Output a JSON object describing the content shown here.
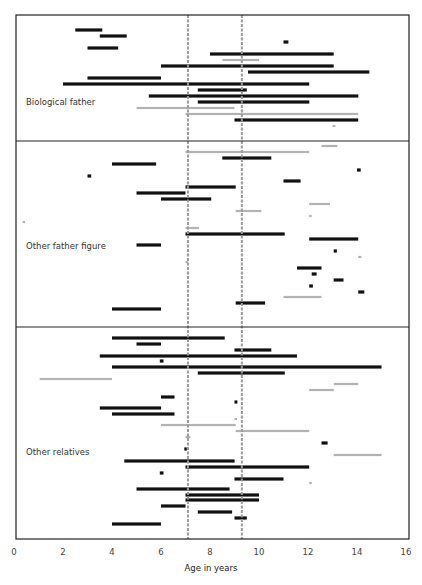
{
  "chart_data": {
    "type": "bar",
    "subtype": "horizontal-range (gantt-like) timeline",
    "title": "",
    "xlabel": "Age in years",
    "ylabel": "",
    "xlim": [
      0,
      16
    ],
    "xticks": [
      0,
      2,
      4,
      6,
      8,
      10,
      12,
      14,
      16
    ],
    "grid": false,
    "legend": null,
    "reference_lines": [
      {
        "x": 7.1,
        "style": "dashed",
        "color": "#9a9a9a"
      },
      {
        "x": 9.3,
        "style": "dashed",
        "color": "#9a9a9a"
      }
    ],
    "colors": {
      "black": "#111111",
      "gray": "#b3b3b3"
    },
    "panels": [
      {
        "label": "Biological father",
        "bars": [
          {
            "y": 30,
            "start": 2.5,
            "end": 3.6,
            "color": "black"
          },
          {
            "y": 36,
            "start": 3.5,
            "end": 4.6,
            "color": "black"
          },
          {
            "y": 42,
            "start": 11.0,
            "end": 11.2,
            "color": "black"
          },
          {
            "y": 48,
            "start": 3.0,
            "end": 4.25,
            "color": "black"
          },
          {
            "y": 54,
            "start": 8.0,
            "end": 13.05,
            "color": "black"
          },
          {
            "y": 60,
            "start": 8.5,
            "end": 10.0,
            "color": "gray"
          },
          {
            "y": 66,
            "start": 6.0,
            "end": 13.05,
            "color": "black"
          },
          {
            "y": 72,
            "start": 9.55,
            "end": 14.5,
            "color": "black"
          },
          {
            "y": 78,
            "start": 3.0,
            "end": 6.0,
            "color": "black"
          },
          {
            "y": 84,
            "start": 2.0,
            "end": 12.05,
            "color": "black"
          },
          {
            "y": 90,
            "start": 7.5,
            "end": 9.5,
            "color": "black"
          },
          {
            "y": 96,
            "start": 5.5,
            "end": 14.05,
            "color": "black"
          },
          {
            "y": 102,
            "start": 7.5,
            "end": 12.05,
            "color": "black"
          },
          {
            "y": 108,
            "start": 5.0,
            "end": 9.0,
            "color": "gray"
          },
          {
            "y": 114,
            "start": 7.0,
            "end": 14.05,
            "color": "gray"
          },
          {
            "y": 120,
            "start": 9.0,
            "end": 14.05,
            "color": "black"
          },
          {
            "y": 126,
            "start": 13.0,
            "end": 13.12,
            "color": "gray"
          }
        ]
      },
      {
        "label": "Other father figure",
        "bars": [
          {
            "y": 146,
            "start": 12.55,
            "end": 13.2,
            "color": "gray"
          },
          {
            "y": 152,
            "start": 7.0,
            "end": 12.05,
            "color": "gray"
          },
          {
            "y": 158,
            "start": 8.5,
            "end": 10.5,
            "color": "black"
          },
          {
            "y": 164,
            "start": 4.0,
            "end": 5.8,
            "color": "black"
          },
          {
            "y": 170,
            "start": 14.0,
            "end": 14.15,
            "color": "black"
          },
          {
            "y": 176,
            "start": 3.0,
            "end": 3.15,
            "color": "black"
          },
          {
            "y": 181,
            "start": 11.0,
            "end": 11.7,
            "color": "black"
          },
          {
            "y": 187,
            "start": 7.0,
            "end": 9.05,
            "color": "black"
          },
          {
            "y": 193,
            "start": 5.0,
            "end": 7.0,
            "color": "black"
          },
          {
            "y": 199,
            "start": 6.0,
            "end": 8.05,
            "color": "black"
          },
          {
            "y": 204,
            "start": 12.05,
            "end": 12.9,
            "color": "gray"
          },
          {
            "y": 211,
            "start": 9.05,
            "end": 10.1,
            "color": "gray"
          },
          {
            "y": 216,
            "start": 12.05,
            "end": 12.15,
            "color": "gray"
          },
          {
            "y": 222,
            "start": 0.35,
            "end": 0.45,
            "color": "gray"
          },
          {
            "y": 228,
            "start": 7.0,
            "end": 7.55,
            "color": "gray"
          },
          {
            "y": 234,
            "start": 7.0,
            "end": 11.05,
            "color": "black"
          },
          {
            "y": 239,
            "start": 12.05,
            "end": 14.05,
            "color": "black"
          },
          {
            "y": 245,
            "start": 5.0,
            "end": 6.0,
            "color": "black"
          },
          {
            "y": 251,
            "start": 13.05,
            "end": 13.18,
            "color": "black"
          },
          {
            "y": 257,
            "start": 14.05,
            "end": 14.18,
            "color": "gray"
          },
          {
            "y": 262,
            "start": 7.0,
            "end": 7.08,
            "color": "gray"
          },
          {
            "y": 268,
            "start": 11.55,
            "end": 12.55,
            "color": "black"
          },
          {
            "y": 274,
            "start": 12.15,
            "end": 12.35,
            "color": "black"
          },
          {
            "y": 280,
            "start": 13.05,
            "end": 13.45,
            "color": "black"
          },
          {
            "y": 286,
            "start": 12.05,
            "end": 12.2,
            "color": "black"
          },
          {
            "y": 292,
            "start": 14.05,
            "end": 14.3,
            "color": "black"
          },
          {
            "y": 297,
            "start": 11.0,
            "end": 12.55,
            "color": "gray"
          },
          {
            "y": 303,
            "start": 9.05,
            "end": 10.25,
            "color": "black"
          },
          {
            "y": 309,
            "start": 4.0,
            "end": 6.0,
            "color": "black"
          }
        ]
      },
      {
        "label": "Other relatives",
        "bars": [
          {
            "y": 338,
            "start": 4.0,
            "end": 8.6,
            "color": "black"
          },
          {
            "y": 344,
            "start": 5.0,
            "end": 6.0,
            "color": "black"
          },
          {
            "y": 350,
            "start": 9.0,
            "end": 10.5,
            "color": "black"
          },
          {
            "y": 356,
            "start": 3.5,
            "end": 11.55,
            "color": "black"
          },
          {
            "y": 361,
            "start": 5.95,
            "end": 6.1,
            "color": "black"
          },
          {
            "y": 367,
            "start": 4.0,
            "end": 15.0,
            "color": "black"
          },
          {
            "y": 373,
            "start": 7.5,
            "end": 11.05,
            "color": "black"
          },
          {
            "y": 379,
            "start": 1.05,
            "end": 4.0,
            "color": "gray"
          },
          {
            "y": 384,
            "start": 13.05,
            "end": 14.05,
            "color": "gray"
          },
          {
            "y": 390,
            "start": 12.05,
            "end": 13.05,
            "color": "gray"
          },
          {
            "y": 397,
            "start": 6.0,
            "end": 6.55,
            "color": "black"
          },
          {
            "y": 402,
            "start": 9.0,
            "end": 9.12,
            "color": "black"
          },
          {
            "y": 408,
            "start": 3.5,
            "end": 6.0,
            "color": "black"
          },
          {
            "y": 414,
            "start": 4.0,
            "end": 6.55,
            "color": "black"
          },
          {
            "y": 419,
            "start": 9.0,
            "end": 9.1,
            "color": "gray"
          },
          {
            "y": 425,
            "start": 6.0,
            "end": 9.05,
            "color": "gray"
          },
          {
            "y": 431,
            "start": 9.05,
            "end": 12.05,
            "color": "gray"
          },
          {
            "y": 437,
            "start": 7.0,
            "end": 7.2,
            "color": "gray"
          },
          {
            "y": 443,
            "start": 12.55,
            "end": 12.8,
            "color": "black"
          },
          {
            "y": 449,
            "start": 6.95,
            "end": 7.05,
            "color": "black"
          },
          {
            "y": 455,
            "start": 13.05,
            "end": 15.0,
            "color": "gray"
          },
          {
            "y": 461,
            "start": 4.5,
            "end": 9.0,
            "color": "black"
          },
          {
            "y": 467,
            "start": 7.0,
            "end": 12.05,
            "color": "black"
          },
          {
            "y": 473,
            "start": 5.95,
            "end": 6.1,
            "color": "black"
          },
          {
            "y": 479,
            "start": 9.0,
            "end": 11.0,
            "color": "black"
          },
          {
            "y": 483,
            "start": 12.05,
            "end": 12.15,
            "color": "gray"
          },
          {
            "y": 489,
            "start": 5.0,
            "end": 8.8,
            "color": "black"
          },
          {
            "y": 495,
            "start": 7.0,
            "end": 10.0,
            "color": "black"
          },
          {
            "y": 500,
            "start": 7.0,
            "end": 10.0,
            "color": "black"
          },
          {
            "y": 506,
            "start": 6.0,
            "end": 7.0,
            "color": "black"
          },
          {
            "y": 512,
            "start": 7.5,
            "end": 8.9,
            "color": "black"
          },
          {
            "y": 518,
            "start": 9.0,
            "end": 9.5,
            "color": "black"
          },
          {
            "y": 524,
            "start": 4.0,
            "end": 6.0,
            "color": "black"
          }
        ]
      }
    ]
  },
  "layout": {
    "panel_labels": [
      {
        "text": "Biological father",
        "y": 102
      },
      {
        "text": "Other father figure",
        "y": 246
      },
      {
        "text": "Other relatives",
        "y": 452
      }
    ]
  }
}
